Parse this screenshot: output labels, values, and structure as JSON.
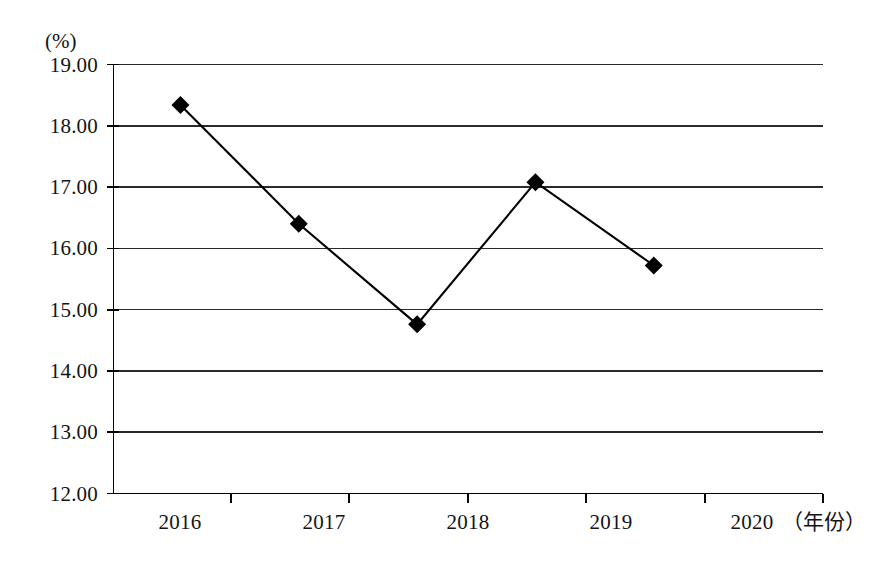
{
  "chart_data": {
    "type": "line",
    "title": "",
    "subtitle": "",
    "xlabel": "（年份）",
    "ylabel": "(%)",
    "categories": [
      "2016",
      "2017",
      "2018",
      "2019",
      "2020"
    ],
    "values": [
      18.34,
      16.4,
      14.76,
      17.08,
      15.72
    ],
    "series": [
      {
        "name": "",
        "values": [
          18.34,
          16.4,
          14.76,
          17.08,
          15.72
        ],
        "marker": "diamond",
        "color": "#000000"
      }
    ],
    "ylim": [
      12.0,
      19.0
    ],
    "ytick_step": 1.0,
    "ytick_labels": [
      "19.00",
      "18.00",
      "17.00",
      "16.00",
      "15.00",
      "14.00",
      "13.00",
      "12.00"
    ],
    "ytick_values": [
      19.0,
      18.0,
      17.0,
      16.0,
      15.0,
      14.0,
      13.0,
      12.0
    ],
    "xtick_labels": [
      "2016",
      "2017",
      "2018",
      "2019",
      "2020"
    ],
    "grid": true,
    "grid_axis": "y",
    "legend": false,
    "legend_position": "none",
    "line_color": "#000000",
    "grid_color": "#333333",
    "axis_color": "#000000",
    "background": "#ffffff",
    "annotations": []
  },
  "axis": {
    "y_unit_label": "(%)",
    "x_name_label": "（年份）"
  }
}
